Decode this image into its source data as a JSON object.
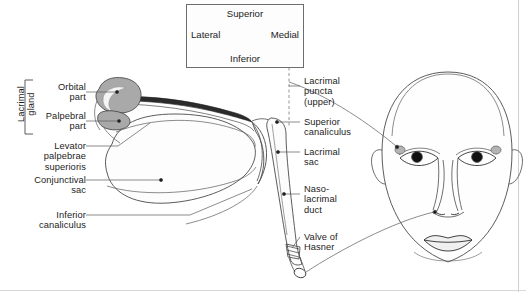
{
  "figure": {
    "orientation_box": {
      "superior": "Superior",
      "inferior": "Inferior",
      "lateral": "Lateral",
      "medial": "Medial",
      "marker": "compass-cross-icon"
    },
    "left_labels": [
      {
        "id": "lacrimal-gland",
        "text": "Lacrimal\ngland",
        "rotated": true
      },
      {
        "id": "orbital-part",
        "text": "Orbital\npart"
      },
      {
        "id": "palpebral-part",
        "text": "Palpebral\npart"
      },
      {
        "id": "levator-palpebrae-superioris",
        "text": "Levator\npalpebrae\nsuperioris"
      },
      {
        "id": "conjunctival-sac",
        "text": "Conjunctival\nsac"
      },
      {
        "id": "inferior-canaliculus",
        "text": "Inferior\ncanaliculus"
      }
    ],
    "right_labels": [
      {
        "id": "lacrimal-puncta-upper",
        "text": "Lacrimal\npuncta\n(upper)"
      },
      {
        "id": "superior-canaliculus",
        "text": "Superior\ncanaliculus"
      },
      {
        "id": "lacrimal-sac",
        "text": "Lacrimal\nsac"
      },
      {
        "id": "naso-lacrimal-duct",
        "text": "Naso-\nlacrimal\nduct"
      },
      {
        "id": "valve-of-hasner",
        "text": "Valve of\nHasner"
      }
    ],
    "colors": {
      "ink": "#1c1c1c",
      "line": "#4a4a4a",
      "gland_fill": "#a9a9a9",
      "gland_light": "#efefef",
      "lid_dark": "#2b2b2b",
      "pupil": "#111111",
      "background": "#ffffff",
      "box_border": "#6d6d6d"
    }
  }
}
